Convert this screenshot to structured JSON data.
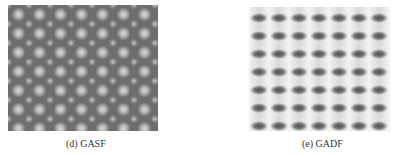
{
  "figures": [
    {
      "id": "gasf",
      "caption": "(d) GASF",
      "pattern": "hexagonal lattice of bright circular blobs on dark gray background",
      "colors": {
        "background": "#6e6e6e",
        "blob": "#d6d6d6"
      }
    },
    {
      "id": "gadf",
      "caption": "(e) GADF",
      "pattern": "grid of dark horizontal elliptical blobs on light gray background, 7 columns x 7 rows",
      "colors": {
        "background": "#d9d9d9",
        "blob": "#555555"
      }
    }
  ]
}
